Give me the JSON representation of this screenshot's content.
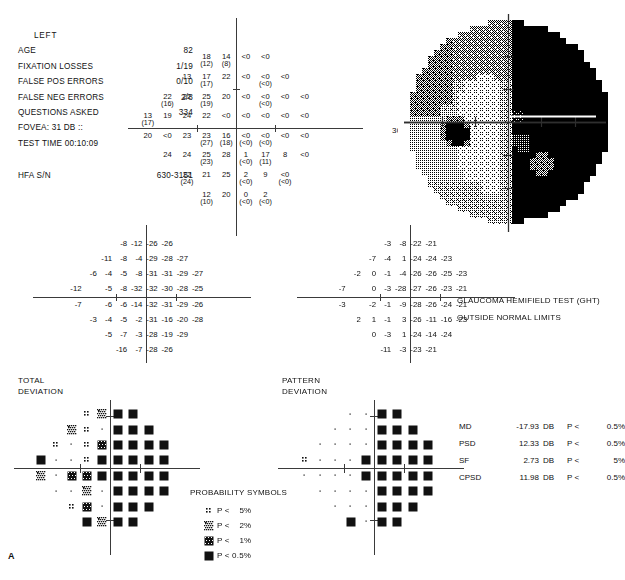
{
  "report": {
    "eye": "LEFT",
    "figure_letter": "A",
    "fields": [
      {
        "label": "AGE",
        "value": "82"
      },
      {
        "label": "FIXATION LOSSES",
        "value": "1/19"
      },
      {
        "label": "FALSE POS ERRORS",
        "value": "0/10"
      },
      {
        "label": "FALSE NEG ERRORS",
        "value": "2/8"
      },
      {
        "label": "QUESTIONS ASKED",
        "value": "334"
      },
      {
        "label": "FOVEA:  31 DB ::",
        "value": ""
      },
      {
        "label": "TEST TIME 00:10:09",
        "value": ""
      }
    ],
    "serial": {
      "label": "HFA S/N",
      "value": "630-3151"
    },
    "degree_label": "30°"
  },
  "ght": {
    "title": "GLAUCOMA HEMIFIELD TEST (GHT)",
    "result": "OUTSIDE NORMAL LIMITS"
  },
  "indices": [
    {
      "name": "MD",
      "value": "-17.93",
      "unit": "DB",
      "p": "P <",
      "level": "0.5%"
    },
    {
      "name": "PSD",
      "value": "12.33",
      "unit": "DB",
      "p": "P <",
      "level": "0.5%"
    },
    {
      "name": "SF",
      "value": "2.73",
      "unit": "DB",
      "p": "P <",
      "level": "5%"
    },
    {
      "name": "CPSD",
      "value": "11.98",
      "unit": "DB",
      "p": "P <",
      "level": "0.5%"
    }
  ],
  "titles": {
    "total_deviation": "TOTAL\nDEVIATION",
    "pattern_deviation": "PATTERN\nDEVIATION"
  },
  "legend": {
    "title": "PROBABILITY SYMBOLS",
    "rows": [
      {
        "symbol": "p5",
        "text": "P <    5%"
      },
      {
        "symbol": "p2",
        "text": "P <    2%"
      },
      {
        "symbol": "p1",
        "text": "P <    1%"
      },
      {
        "symbol": "p05",
        "text": "P < 0.5%"
      }
    ]
  },
  "chart_data": {
    "type": "table",
    "threshold": {
      "label": "Threshold sensitivities (dB), retest values in parentheses",
      "columns_x": [
        -27,
        -21,
        -15,
        -9,
        -3,
        3,
        9,
        15,
        21,
        27
      ],
      "rows_y": [
        27,
        21,
        15,
        9,
        3,
        -3,
        -9,
        -15,
        -21,
        -27
      ],
      "points": [
        {
          "x": -9,
          "y": 21,
          "v": "18",
          "p": "(12)"
        },
        {
          "x": -3,
          "y": 21,
          "v": "14",
          "p": "(8)"
        },
        {
          "x": 3,
          "y": 21,
          "v": "<0",
          "p": ""
        },
        {
          "x": 9,
          "y": 21,
          "v": "<0",
          "p": ""
        },
        {
          "x": -15,
          "y": 15,
          "v": "13",
          "p": ""
        },
        {
          "x": -9,
          "y": 15,
          "v": "17",
          "p": "(17)"
        },
        {
          "x": -3,
          "y": 15,
          "v": "22",
          "p": ""
        },
        {
          "x": 3,
          "y": 15,
          "v": "<0",
          "p": ""
        },
        {
          "x": 9,
          "y": 15,
          "v": "<0",
          "p": "(<0)"
        },
        {
          "x": 15,
          "y": 15,
          "v": "<0",
          "p": ""
        },
        {
          "x": -21,
          "y": 9,
          "v": "22",
          "p": "(16)"
        },
        {
          "x": -15,
          "y": 9,
          "v": "22",
          "p": ""
        },
        {
          "x": -9,
          "y": 9,
          "v": "25",
          "p": "(19)"
        },
        {
          "x": -3,
          "y": 9,
          "v": "20",
          "p": ""
        },
        {
          "x": 3,
          "y": 9,
          "v": "<0",
          "p": ""
        },
        {
          "x": 9,
          "y": 9,
          "v": "<0",
          "p": "(<0)"
        },
        {
          "x": 15,
          "y": 9,
          "v": "<0",
          "p": ""
        },
        {
          "x": 21,
          "y": 9,
          "v": "<0",
          "p": ""
        },
        {
          "x": -27,
          "y": 3,
          "v": "13",
          "p": "(17)"
        },
        {
          "x": -21,
          "y": 3,
          "v": "19",
          "p": ""
        },
        {
          "x": -15,
          "y": 3,
          "v": "24",
          "p": ""
        },
        {
          "x": -9,
          "y": 3,
          "v": "22",
          "p": ""
        },
        {
          "x": -3,
          "y": 3,
          "v": "<0",
          "p": ""
        },
        {
          "x": 3,
          "y": 3,
          "v": "<0",
          "p": ""
        },
        {
          "x": 9,
          "y": 3,
          "v": "<0",
          "p": ""
        },
        {
          "x": 15,
          "y": 3,
          "v": "<0",
          "p": ""
        },
        {
          "x": 21,
          "y": 3,
          "v": "<0",
          "p": ""
        },
        {
          "x": -27,
          "y": -3,
          "v": "20",
          "p": ""
        },
        {
          "x": -21,
          "y": -3,
          "v": "<0",
          "p": ""
        },
        {
          "x": -15,
          "y": -3,
          "v": "23",
          "p": ""
        },
        {
          "x": -9,
          "y": -3,
          "v": "23",
          "p": "(27)"
        },
        {
          "x": -3,
          "y": -3,
          "v": "16",
          "p": "(18)"
        },
        {
          "x": 3,
          "y": -3,
          "v": "<0",
          "p": "(<0)"
        },
        {
          "x": 9,
          "y": -3,
          "v": "<0",
          "p": "(<0)"
        },
        {
          "x": 15,
          "y": -3,
          "v": "<0",
          "p": ""
        },
        {
          "x": 21,
          "y": -3,
          "v": "<0",
          "p": ""
        },
        {
          "x": -21,
          "y": -9,
          "v": "24",
          "p": ""
        },
        {
          "x": -15,
          "y": -9,
          "v": "24",
          "p": ""
        },
        {
          "x": -9,
          "y": -9,
          "v": "25",
          "p": "(23)"
        },
        {
          "x": -3,
          "y": -9,
          "v": "28",
          "p": ""
        },
        {
          "x": 3,
          "y": -9,
          "v": "1",
          "p": "(<0)"
        },
        {
          "x": 9,
          "y": -9,
          "v": "17",
          "p": "(11)"
        },
        {
          "x": 15,
          "y": -9,
          "v": "8",
          "p": ""
        },
        {
          "x": 21,
          "y": -9,
          "v": "<0",
          "p": ""
        },
        {
          "x": -15,
          "y": -15,
          "v": "22",
          "p": "(24)"
        },
        {
          "x": -9,
          "y": -15,
          "v": "21",
          "p": ""
        },
        {
          "x": -3,
          "y": -15,
          "v": "25",
          "p": ""
        },
        {
          "x": 3,
          "y": -15,
          "v": "2",
          "p": "(<0)"
        },
        {
          "x": 9,
          "y": -15,
          "v": "9",
          "p": ""
        },
        {
          "x": 15,
          "y": -15,
          "v": "<0",
          "p": "(<0)"
        },
        {
          "x": -9,
          "y": -21,
          "v": "12",
          "p": "(10)"
        },
        {
          "x": -3,
          "y": -21,
          "v": "20",
          "p": ""
        },
        {
          "x": 3,
          "y": -21,
          "v": "0",
          "p": "(<0)"
        },
        {
          "x": 9,
          "y": -21,
          "v": "2",
          "p": "(<0)"
        }
      ]
    },
    "total_deviation": {
      "label": "Total deviation (dB)",
      "rows": [
        {
          "y": 21,
          "xs": [
            -9,
            -3,
            3,
            9
          ],
          "vals": [
            "-8",
            "-12",
            "-26",
            "-26"
          ]
        },
        {
          "y": 15,
          "xs": [
            -15,
            -9,
            -3,
            3,
            9,
            15
          ],
          "vals": [
            "-11",
            "-8",
            "-4",
            "-29",
            "-28",
            "-27"
          ]
        },
        {
          "y": 9,
          "xs": [
            -21,
            -15,
            -9,
            -3,
            3,
            9,
            15,
            21
          ],
          "vals": [
            "-6",
            "-4",
            "-5",
            "-8",
            "-31",
            "-31",
            "-29",
            "-27"
          ]
        },
        {
          "y": 3,
          "xs": [
            -27,
            -15,
            -9,
            -3,
            3,
            9,
            15,
            21
          ],
          "vals": [
            "-12",
            "-5",
            "-8",
            "-32",
            "-32",
            "-30",
            "-28",
            "-25"
          ]
        },
        {
          "y": -3,
          "xs": [
            -27,
            -15,
            -9,
            -3,
            3,
            9,
            15,
            21
          ],
          "vals": [
            "-7",
            "-6",
            "-6",
            "-14",
            "-32",
            "-31",
            "-29",
            "-26"
          ]
        },
        {
          "y": -9,
          "xs": [
            -21,
            -15,
            -9,
            -3,
            3,
            9,
            15,
            21
          ],
          "vals": [
            "-3",
            "-4",
            "-5",
            "-2",
            "-31",
            "-16",
            "-20",
            "-28"
          ]
        },
        {
          "y": -15,
          "xs": [
            -15,
            -9,
            -3,
            3,
            9,
            15
          ],
          "vals": [
            "-5",
            "-7",
            "-3",
            "-28",
            "-19",
            "-29"
          ]
        },
        {
          "y": -21,
          "xs": [
            -9,
            -3,
            3,
            9
          ],
          "vals": [
            "-16",
            "-7",
            "-28",
            "-26"
          ]
        }
      ]
    },
    "pattern_deviation": {
      "label": "Pattern deviation (dB)",
      "rows": [
        {
          "y": 21,
          "xs": [
            -9,
            -3,
            3,
            9
          ],
          "vals": [
            "-3",
            "-8",
            "-22",
            "-21"
          ]
        },
        {
          "y": 15,
          "xs": [
            -15,
            -9,
            -3,
            3,
            9,
            15
          ],
          "vals": [
            "-7",
            "-4",
            "1",
            "-24",
            "-24",
            "-23"
          ]
        },
        {
          "y": 9,
          "xs": [
            -21,
            -15,
            -9,
            -3,
            3,
            9,
            15,
            21
          ],
          "vals": [
            "-2",
            "0",
            "-1",
            "-4",
            "-26",
            "-26",
            "-25",
            "-23"
          ]
        },
        {
          "y": 3,
          "xs": [
            -27,
            -15,
            -9,
            -3,
            3,
            9,
            15,
            21
          ],
          "vals": [
            "-7",
            "0",
            "-3",
            "-28",
            "-27",
            "-26",
            "-23",
            "-21"
          ]
        },
        {
          "y": -3,
          "xs": [
            -27,
            -15,
            -9,
            -3,
            3,
            9,
            15,
            21
          ],
          "vals": [
            "-3",
            "-2",
            "-1",
            "-9",
            "-28",
            "-26",
            "-24",
            "-21"
          ]
        },
        {
          "y": -9,
          "xs": [
            -21,
            -15,
            -9,
            -3,
            3,
            9,
            15,
            21
          ],
          "vals": [
            "2",
            "1",
            "-1",
            "3",
            "-26",
            "-11",
            "-16",
            "-23"
          ]
        },
        {
          "y": -15,
          "xs": [
            -15,
            -9,
            -3,
            3,
            9,
            15
          ],
          "vals": [
            "0",
            "-3",
            "1",
            "-24",
            "-14",
            "-24"
          ]
        },
        {
          "y": -21,
          "xs": [
            -9,
            -3,
            3,
            9
          ],
          "vals": [
            "-11",
            "-3",
            "-23",
            "-21"
          ]
        }
      ]
    },
    "total_deviation_probability": {
      "label": "Total deviation probability symbols",
      "legend_codes": [
        "blank",
        "p5",
        "p2",
        "p1",
        "p05"
      ],
      "rows": [
        {
          "y": 21,
          "xs": [
            -9,
            -3,
            3,
            9
          ],
          "syms": [
            "p5",
            "p2",
            "p05",
            "p05"
          ]
        },
        {
          "y": 15,
          "xs": [
            -15,
            -9,
            -3,
            3,
            9,
            15
          ],
          "syms": [
            "p2",
            "p5",
            "blank",
            "p05",
            "p05",
            "p05"
          ]
        },
        {
          "y": 9,
          "xs": [
            -21,
            -15,
            -9,
            -3,
            3,
            9,
            15,
            21
          ],
          "syms": [
            "p5",
            "blank",
            "p5",
            "p1",
            "p05",
            "p05",
            "p05",
            "p05"
          ]
        },
        {
          "y": 3,
          "xs": [
            -27,
            -21,
            -15,
            -9,
            -3,
            3,
            9,
            15,
            21
          ],
          "syms": [
            "p05",
            "blank",
            "blank",
            "p5",
            "p05",
            "p05",
            "p05",
            "p05",
            "p05"
          ]
        },
        {
          "y": -3,
          "xs": [
            -27,
            -21,
            -15,
            -9,
            -3,
            3,
            9,
            15,
            21
          ],
          "syms": [
            "p2",
            "blank",
            "p1",
            "p1",
            "p05",
            "p05",
            "p05",
            "p05",
            "p05"
          ]
        },
        {
          "y": -9,
          "xs": [
            -21,
            -15,
            -9,
            -3,
            3,
            9,
            15,
            21
          ],
          "syms": [
            "blank",
            "blank",
            "p2",
            "blank",
            "p05",
            "p05",
            "p05",
            "p05"
          ]
        },
        {
          "y": -15,
          "xs": [
            -15,
            -9,
            -3,
            3,
            9,
            15
          ],
          "syms": [
            "p5",
            "p1",
            "blank",
            "p05",
            "p05",
            "p05"
          ]
        },
        {
          "y": -21,
          "xs": [
            -9,
            -3,
            3,
            9
          ],
          "syms": [
            "p05",
            "p2",
            "p05",
            "p05"
          ]
        }
      ]
    },
    "pattern_deviation_probability": {
      "label": "Pattern deviation probability symbols",
      "legend_codes": [
        "blank",
        "p5",
        "p2",
        "p1",
        "p05"
      ],
      "rows": [
        {
          "y": 21,
          "xs": [
            -9,
            -3,
            3,
            9
          ],
          "syms": [
            "blank",
            "blank",
            "p05",
            "p05"
          ]
        },
        {
          "y": 15,
          "xs": [
            -15,
            -9,
            -3,
            3,
            9,
            15
          ],
          "syms": [
            "blank",
            "blank",
            "blank",
            "p05",
            "p05",
            "p05"
          ]
        },
        {
          "y": 9,
          "xs": [
            -21,
            -15,
            -9,
            -3,
            3,
            9,
            15,
            21
          ],
          "syms": [
            "blank",
            "blank",
            "blank",
            "blank",
            "p05",
            "p05",
            "p05",
            "p05"
          ]
        },
        {
          "y": 3,
          "xs": [
            -27,
            -21,
            -15,
            -9,
            -3,
            3,
            9,
            15,
            21
          ],
          "syms": [
            "p5",
            "blank",
            "blank",
            "blank",
            "p05",
            "p05",
            "p05",
            "p05",
            "p05"
          ]
        },
        {
          "y": -3,
          "xs": [
            -27,
            -21,
            -15,
            -9,
            -3,
            3,
            9,
            15,
            21
          ],
          "syms": [
            "blank",
            "blank",
            "blank",
            "blank",
            "p05",
            "p05",
            "p05",
            "p05",
            "p05"
          ]
        },
        {
          "y": -9,
          "xs": [
            -21,
            -15,
            -9,
            -3,
            3,
            9,
            15,
            21
          ],
          "syms": [
            "blank",
            "blank",
            "blank",
            "blank",
            "p05",
            "p05",
            "p05",
            "p05"
          ]
        },
        {
          "y": -15,
          "xs": [
            -15,
            -9,
            -3,
            3,
            9,
            15
          ],
          "syms": [
            "blank",
            "blank",
            "blank",
            "p05",
            "p05",
            "p05"
          ]
        },
        {
          "y": -21,
          "xs": [
            -9,
            -3,
            3,
            9
          ],
          "syms": [
            "p05",
            "blank",
            "p05",
            "p05"
          ]
        }
      ]
    },
    "grayscale": {
      "label": "Grayscale sensitivity map",
      "levels": [
        0,
        1,
        2,
        3,
        4,
        5,
        6,
        7,
        8,
        9
      ],
      "description": "Dense absolute defect in the entire right (nasal) hemifield; relative depression superonasal-left; small dense spot at blind spot location"
    }
  }
}
